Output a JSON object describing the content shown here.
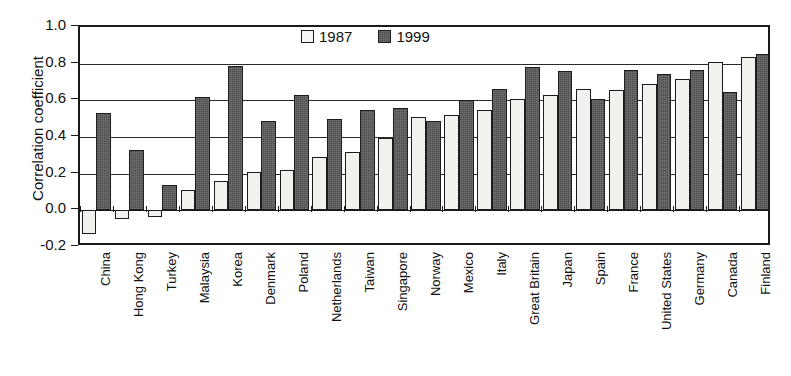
{
  "chart_data": {
    "type": "bar",
    "title": "",
    "xlabel": "",
    "ylabel": "Correlation coefficient",
    "ylim": [
      -0.2,
      1.0
    ],
    "ytick_labels": [
      "1.0",
      "0.8",
      "0.6",
      "0.4",
      "0.2",
      "0.0",
      "-0.2"
    ],
    "ytick_values": [
      1.0,
      0.8,
      0.6,
      0.4,
      0.2,
      0.0,
      -0.2
    ],
    "grid": true,
    "legend_position": "top-center",
    "categories": [
      "China",
      "Hong Kong",
      "Turkey",
      "Malaysia",
      "Korea",
      "Denmark",
      "Poland",
      "Netherlands",
      "Taiwan",
      "Singapore",
      "Norway",
      "Mexico",
      "Italy",
      "Great Britain",
      "Japan",
      "Spain",
      "France",
      "United States",
      "Germany",
      "Canada",
      "Finland"
    ],
    "series": [
      {
        "name": "1987",
        "values": [
          -0.13,
          -0.05,
          -0.035,
          0.11,
          0.16,
          0.21,
          0.22,
          0.29,
          0.32,
          0.395,
          0.51,
          0.52,
          0.545,
          0.61,
          0.63,
          0.66,
          0.655,
          0.69,
          0.715,
          0.81,
          0.835
        ]
      },
      {
        "name": "1999",
        "values": [
          0.53,
          0.33,
          0.14,
          0.62,
          0.79,
          0.49,
          0.63,
          0.5,
          0.55,
          0.56,
          0.485,
          0.6,
          0.66,
          0.78,
          0.76,
          0.61,
          0.765,
          0.745,
          0.765,
          0.645,
          0.855
        ]
      }
    ],
    "colors": {
      "series_1987": "#f1f1ee",
      "series_1999": "#4e4e4e",
      "axis": "#1a1a1a",
      "grid": "#2b2b2b",
      "background": "#ffffff"
    }
  },
  "legend": {
    "items": [
      {
        "label": "1987",
        "swatch": "light-square-swatch"
      },
      {
        "label": "1999",
        "swatch": "dark-square-swatch"
      }
    ]
  }
}
